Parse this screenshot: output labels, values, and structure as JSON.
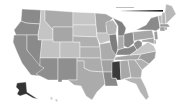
{
  "map": {
    "type": "choropleth",
    "region": "United States",
    "colorscale": "grayscale",
    "legend": {
      "title": "",
      "ticks": [],
      "gradient_start": "#f2f2f2",
      "gradient_end": "#111111"
    },
    "states": [
      {
        "id": "WA",
        "fill": "#8a8a8a"
      },
      {
        "id": "OR",
        "fill": "#8c8c8c"
      },
      {
        "id": "CA",
        "fill": "#8e8e8e"
      },
      {
        "id": "ID",
        "fill": "#c4c4c4"
      },
      {
        "id": "NV",
        "fill": "#8a8a8a"
      },
      {
        "id": "MT",
        "fill": "#aaaaaa"
      },
      {
        "id": "WY",
        "fill": "#a6a6a6"
      },
      {
        "id": "UT",
        "fill": "#c2c2c2"
      },
      {
        "id": "AZ",
        "fill": "#8e8e8e"
      },
      {
        "id": "CO",
        "fill": "#c0c0c0"
      },
      {
        "id": "NM",
        "fill": "#8f8f8f"
      },
      {
        "id": "ND",
        "fill": "#c6c6c6"
      },
      {
        "id": "SD",
        "fill": "#c4c4c4"
      },
      {
        "id": "NE",
        "fill": "#b0b0b0"
      },
      {
        "id": "KS",
        "fill": "#b2b2b2"
      },
      {
        "id": "OK",
        "fill": "#acacac"
      },
      {
        "id": "TX",
        "fill": "#ababab"
      },
      {
        "id": "MN",
        "fill": "#a4a4a4"
      },
      {
        "id": "IA",
        "fill": "#c2c2c2"
      },
      {
        "id": "MO",
        "fill": "#acacac"
      },
      {
        "id": "AR",
        "fill": "#a2a2a2"
      },
      {
        "id": "LA",
        "fill": "#8a8a8a"
      },
      {
        "id": "WI",
        "fill": "#b4b4b4"
      },
      {
        "id": "IL",
        "fill": "#7e7e7e"
      },
      {
        "id": "MI",
        "fill": "#808080"
      },
      {
        "id": "IN",
        "fill": "#aaaaaa"
      },
      {
        "id": "OH",
        "fill": "#8a8a8a"
      },
      {
        "id": "KY",
        "fill": "#868686"
      },
      {
        "id": "TN",
        "fill": "#a6a6a6"
      },
      {
        "id": "MS",
        "fill": "#3a3a3a"
      },
      {
        "id": "AL",
        "fill": "#a8a8a8"
      },
      {
        "id": "GA",
        "fill": "#acacac"
      },
      {
        "id": "FL",
        "fill": "#b4b4b4"
      },
      {
        "id": "SC",
        "fill": "#b0b0b0"
      },
      {
        "id": "NC",
        "fill": "#9c9c9c"
      },
      {
        "id": "VA",
        "fill": "#c6c6c6"
      },
      {
        "id": "WV",
        "fill": "#8e8e8e"
      },
      {
        "id": "PA",
        "fill": "#a6a6a6"
      },
      {
        "id": "NY",
        "fill": "#8a8a8a"
      },
      {
        "id": "VT",
        "fill": "#b8b8b8"
      },
      {
        "id": "NH",
        "fill": "#b4b4b4"
      },
      {
        "id": "ME",
        "fill": "#b8b8b8"
      },
      {
        "id": "MA",
        "fill": "#9a9a9a"
      },
      {
        "id": "CT",
        "fill": "#a0a0a0"
      },
      {
        "id": "RI",
        "fill": "#a0a0a0"
      },
      {
        "id": "NJ",
        "fill": "#9a9a9a"
      },
      {
        "id": "DE",
        "fill": "#a8a8a8"
      },
      {
        "id": "MD",
        "fill": "#a4a4a4"
      },
      {
        "id": "AK",
        "fill": "#333333"
      },
      {
        "id": "HI",
        "fill": "#c8c8c8"
      }
    ]
  }
}
